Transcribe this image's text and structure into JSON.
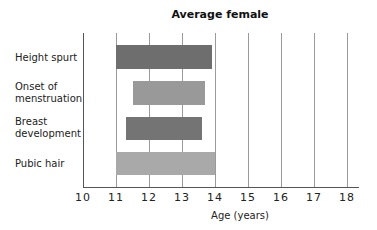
{
  "chart_data": {
    "type": "bar",
    "orientation": "horizontal-range",
    "title": "Average female",
    "xlabel": "Age (years)",
    "ylabel": "",
    "xlim": [
      10,
      18
    ],
    "xticks": [
      "10",
      "11",
      "12",
      "13",
      "14",
      "15",
      "16",
      "17",
      "18"
    ],
    "grid": true,
    "legend": "none",
    "categories": [
      "Height spurt",
      "Onset of menstruation",
      "Breast development",
      "Pubic hair"
    ],
    "series": [
      {
        "name": "Age range",
        "values": [
          {
            "category": "Height spurt",
            "start": 11.0,
            "end": 13.9,
            "color": "#6e6e6e"
          },
          {
            "category": "Onset of menstruation",
            "start": 11.5,
            "end": 13.7,
            "color": "#999999"
          },
          {
            "category": "Breast development",
            "start": 11.3,
            "end": 13.6,
            "color": "#747474"
          },
          {
            "category": "Pubic hair",
            "start": 11.0,
            "end": 14.0,
            "color": "#a9a9a9"
          }
        ]
      }
    ]
  },
  "labels": {
    "title": "Average female",
    "xlabel": "Age (years)",
    "categories": [
      {
        "line1": "Height spurt",
        "line2": ""
      },
      {
        "line1": "Onset of",
        "line2": "menstruation"
      },
      {
        "line1": "Breast",
        "line2": "development"
      },
      {
        "line1": "Pubic hair",
        "line2": ""
      }
    ]
  }
}
